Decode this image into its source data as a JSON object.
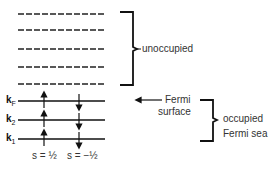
{
  "diagram": {
    "unoccupied_label": "unoccupied",
    "fermi_surface_label_line1": "Fermi",
    "fermi_surface_label_line2": "surface",
    "occupied_label_line1": "occupied",
    "occupied_label_line2": "Fermi sea",
    "levels_occupied": [
      {
        "name": "k",
        "sub": "F"
      },
      {
        "name": "k",
        "sub": "2"
      },
      {
        "name": "k",
        "sub": "1"
      }
    ],
    "levels_unoccupied_count": 5,
    "spin_up_label": "s = ½",
    "spin_down_label": "s = −½"
  }
}
